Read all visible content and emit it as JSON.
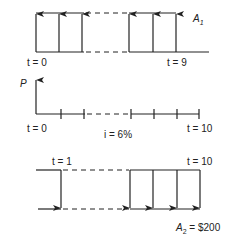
{
  "diagram": {
    "type": "cash-flow-diagram",
    "top": {
      "series_label": "A",
      "series_sub": "1",
      "start_label": "t = 0",
      "end_label": "t = 9",
      "direction": "up"
    },
    "middle": {
      "axis_label": "P",
      "start_label": "t = 0",
      "end_label": "t = 10",
      "rate_label": "i = 6%"
    },
    "bottom": {
      "start_label": "t = 1",
      "end_label": "t = 10",
      "series_label": "A",
      "series_sub": "2",
      "series_value": " = $200",
      "direction": "down"
    },
    "colors": {
      "line": "#222222",
      "background": "#ffffff"
    }
  }
}
